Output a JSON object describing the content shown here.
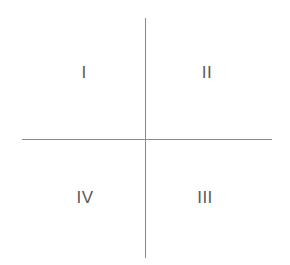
{
  "figure": {
    "name": "quadrant-diagram",
    "width": 290,
    "height": 265,
    "background_color": "#ffffff"
  },
  "axes": {
    "line_color": "#8a8a8a",
    "line_width": 1.5,
    "origin": {
      "x": 145.5,
      "y": 139.5
    },
    "vertical": {
      "x": 145.5,
      "y_start": 18,
      "y_end": 258
    },
    "horizontal": {
      "y": 139.5,
      "x_start": 22,
      "x_end": 272
    }
  },
  "labels": {
    "text_color": "#595959",
    "font_size": 17,
    "quadrants": [
      {
        "id": "q1",
        "text": "I",
        "position": "top-left",
        "x": 84,
        "y": 72
      },
      {
        "id": "q2",
        "text": "II",
        "position": "top-right",
        "x": 207,
        "y": 72
      },
      {
        "id": "q3",
        "text": "III",
        "position": "bottom-right",
        "x": 205,
        "y": 197
      },
      {
        "id": "q4",
        "text": "IV",
        "position": "bottom-left",
        "x": 85,
        "y": 197
      }
    ]
  }
}
